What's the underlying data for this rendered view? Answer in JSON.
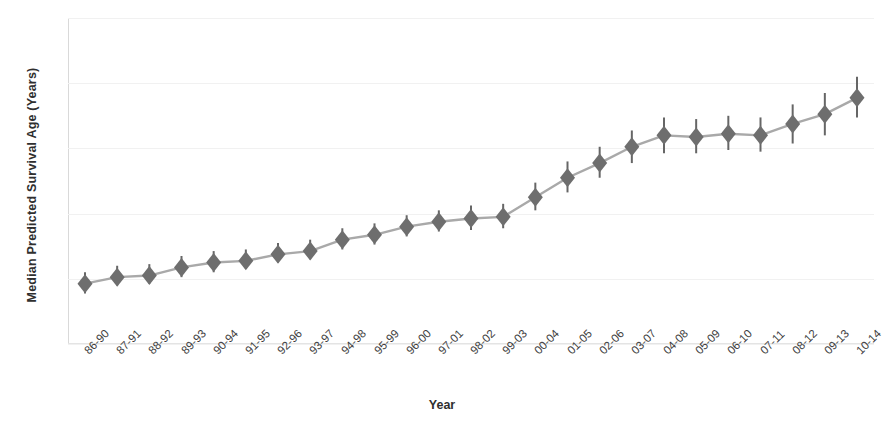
{
  "chart_data": {
    "type": "line",
    "title": "",
    "xlabel": "Year",
    "ylabel": "Median Predicted Survival Age (Years)",
    "ylim": [
      24,
      44
    ],
    "yticks": [
      24,
      28,
      32,
      36,
      40,
      44
    ],
    "grid": true,
    "legend": false,
    "marker": "diamond",
    "errorbars": true,
    "categories": [
      "86-90",
      "87-91",
      "88-92",
      "89-93",
      "90-94",
      "91-95",
      "92-96",
      "93-97",
      "94-98",
      "95-99",
      "96-00",
      "97-01",
      "98-02",
      "99-03",
      "00-04",
      "01-05",
      "02-06",
      "03-07",
      "04-08",
      "05-09",
      "06-10",
      "07-11",
      "08-12",
      "09-13",
      "10-14"
    ],
    "values": [
      27.7,
      28.1,
      28.2,
      28.7,
      29.0,
      29.1,
      29.5,
      29.7,
      30.4,
      30.7,
      31.2,
      31.5,
      31.7,
      31.8,
      33.0,
      34.2,
      35.1,
      36.1,
      36.8,
      36.7,
      36.9,
      36.8,
      37.5,
      38.1,
      39.1
    ],
    "err_low": [
      27.1,
      27.6,
      27.7,
      28.1,
      28.4,
      28.6,
      29.0,
      29.2,
      29.8,
      30.1,
      30.6,
      30.9,
      31.0,
      31.1,
      32.2,
      33.3,
      34.2,
      35.1,
      35.7,
      35.7,
      35.9,
      35.8,
      36.3,
      36.8,
      37.9
    ],
    "err_high": [
      28.4,
      28.8,
      28.9,
      29.4,
      29.7,
      29.8,
      30.2,
      30.4,
      31.1,
      31.4,
      31.9,
      32.2,
      32.5,
      32.6,
      33.9,
      35.2,
      36.1,
      37.1,
      37.9,
      37.8,
      38.0,
      37.9,
      38.7,
      39.4,
      40.4
    ],
    "colors": {
      "marker": "#6e6e6e",
      "line": "#a9a9a9",
      "errorbar": "#666666",
      "grid": "#f1f1f1",
      "axis": "#d9d9d9",
      "text": "#3d3d3d"
    }
  },
  "caption": ""
}
